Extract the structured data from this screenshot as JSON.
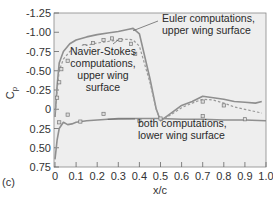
{
  "figure_label": "(c)",
  "chart_data": {
    "type": "line",
    "title": "",
    "xlabel": "x/c",
    "ylabel": "Cp",
    "xlim": [
      0,
      1.0
    ],
    "ylim": [
      -1.25,
      0.75
    ],
    "y_inverted": true,
    "grid": false,
    "x_ticks": [
      "0",
      "0.1",
      "0.2",
      "0.3",
      "0.4",
      "0.5",
      "0.6",
      "0.7",
      "0.8",
      "0.9",
      "1.0"
    ],
    "y_ticks": [
      "-1.25",
      "-1.00",
      "-0.75",
      "-0.50",
      "-0.25",
      "0",
      "0.25",
      "0.50",
      "0.75"
    ],
    "series": [
      {
        "name": "Euler computations, upper wing surface",
        "style": "solid",
        "x": [
          0.0,
          0.01,
          0.02,
          0.04,
          0.07,
          0.1,
          0.15,
          0.2,
          0.25,
          0.3,
          0.35,
          0.37,
          0.4,
          0.45,
          0.48,
          0.5,
          0.55,
          0.6,
          0.65,
          0.7,
          0.75,
          0.8,
          0.85,
          0.9,
          0.95,
          0.98
        ],
        "y": [
          0.1,
          -0.3,
          -0.6,
          -0.75,
          -0.85,
          -0.9,
          -0.94,
          -0.97,
          -0.99,
          -1.01,
          -1.04,
          -1.05,
          -0.98,
          -0.4,
          0.0,
          0.15,
          0.05,
          -0.05,
          -0.1,
          -0.17,
          -0.15,
          -0.13,
          -0.1,
          -0.09,
          -0.08,
          -0.1
        ]
      },
      {
        "name": "Navier-Stokes computations, upper wing surface",
        "style": "dashed",
        "x": [
          0.0,
          0.01,
          0.02,
          0.04,
          0.07,
          0.1,
          0.15,
          0.2,
          0.25,
          0.3,
          0.35,
          0.37,
          0.4,
          0.45,
          0.48,
          0.5,
          0.55,
          0.6,
          0.65,
          0.7,
          0.75,
          0.8,
          0.85,
          0.9,
          0.95,
          0.98
        ],
        "y": [
          0.1,
          -0.25,
          -0.5,
          -0.65,
          -0.75,
          -0.8,
          -0.83,
          -0.86,
          -0.88,
          -0.9,
          -0.91,
          -0.9,
          -0.82,
          -0.35,
          0.0,
          0.15,
          0.07,
          -0.02,
          -0.08,
          -0.13,
          -0.12,
          -0.08,
          -0.03,
          0.0,
          0.03,
          0.05
        ]
      },
      {
        "name": "both computations, lower wing surface",
        "style": "solid",
        "x": [
          0.0,
          0.01,
          0.02,
          0.04,
          0.06,
          0.08,
          0.1,
          0.15,
          0.2,
          0.3,
          0.4,
          0.5,
          0.6,
          0.7,
          0.8,
          0.9,
          1.0
        ],
        "y": [
          0.65,
          0.4,
          0.25,
          0.17,
          0.2,
          0.19,
          0.17,
          0.15,
          0.14,
          0.12,
          0.12,
          0.12,
          0.13,
          0.13,
          0.14,
          0.14,
          0.15
        ]
      },
      {
        "name": "experimental data, upper surface",
        "style": "markers",
        "x": [
          0.01,
          0.02,
          0.03,
          0.06,
          0.1,
          0.14,
          0.18,
          0.23,
          0.27,
          0.31,
          0.36,
          0.38,
          0.5,
          0.7,
          0.8
        ],
        "y": [
          -0.15,
          -0.35,
          -0.52,
          -0.63,
          -0.77,
          -0.82,
          -0.86,
          -0.9,
          -0.92,
          -0.9,
          -0.85,
          -0.72,
          0.12,
          -0.1,
          -0.05
        ]
      },
      {
        "name": "experimental data, lower surface",
        "style": "markers",
        "x": [
          0.02,
          0.06,
          0.12,
          0.23,
          0.4,
          0.7,
          0.9
        ],
        "y": [
          0.17,
          0.07,
          0.16,
          0.06,
          0.15,
          0.09,
          0.13
        ]
      }
    ],
    "annotations": [
      {
        "text_lines": [
          "Euler computations,",
          "upper wing surface"
        ],
        "points_to": [
          0.37,
          -1.02
        ]
      },
      {
        "text_lines": [
          "Navier-Stokes",
          "computations,",
          "upper wing",
          "surface"
        ],
        "points_to": [
          0.3,
          -0.9
        ]
      },
      {
        "text_lines": [
          "both computations,",
          "lower wing surface"
        ],
        "points_to": [
          0.25,
          0.13
        ]
      }
    ]
  }
}
